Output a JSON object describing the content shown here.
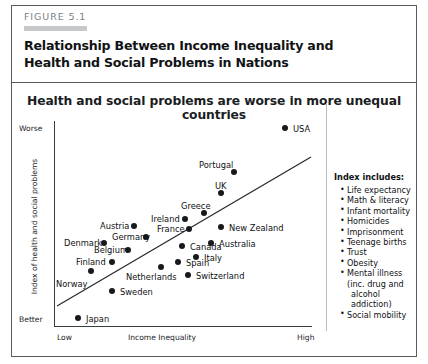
{
  "figure": {
    "number": "FIGURE 5.1",
    "title": "Relationship Between Income Inequality and Health and Social Problems in Nations"
  },
  "chart_data": {
    "type": "scatter",
    "title": "Health and social problems are worse in more unequal countries",
    "xlabel": "Income Inequality",
    "ylabel": "Index of health and social problems",
    "x_tick_labels": [
      "Low",
      "High"
    ],
    "y_tick_labels": [
      "Worse",
      "Better"
    ],
    "grid": false,
    "trendline": true,
    "points": [
      {
        "label": "USA",
        "px": 285,
        "py": 128,
        "lx": 293,
        "ly": 124
      },
      {
        "label": "Portugal",
        "px": 234,
        "py": 172,
        "lx": 199,
        "ly": 160
      },
      {
        "label": "UK",
        "px": 221,
        "py": 193,
        "lx": 215,
        "ly": 181
      },
      {
        "label": "Greece",
        "px": 204,
        "py": 213,
        "lx": 181,
        "ly": 201
      },
      {
        "label": "New Zealand",
        "px": 221,
        "py": 227,
        "lx": 229,
        "ly": 223
      },
      {
        "label": "Australia",
        "px": 211,
        "py": 243,
        "lx": 219,
        "ly": 239
      },
      {
        "label": "Ireland",
        "px": 185,
        "py": 219,
        "lx": 151,
        "ly": 214
      },
      {
        "label": "France",
        "px": 189,
        "py": 229,
        "lx": 157,
        "ly": 224
      },
      {
        "label": "Canada",
        "px": 182,
        "py": 246,
        "lx": 190,
        "ly": 242
      },
      {
        "label": "Italy",
        "px": 196,
        "py": 257,
        "lx": 204,
        "ly": 253
      },
      {
        "label": "Spain",
        "px": 178,
        "py": 262,
        "lx": 186,
        "ly": 258
      },
      {
        "label": "Switzerland",
        "px": 188,
        "py": 275,
        "lx": 196,
        "ly": 271
      },
      {
        "label": "Austria",
        "px": 134,
        "py": 226,
        "lx": 100,
        "ly": 221
      },
      {
        "label": "Germany",
        "px": 146,
        "py": 237,
        "lx": 112,
        "ly": 232
      },
      {
        "label": "Belgium",
        "px": 128,
        "py": 250,
        "lx": 94,
        "ly": 245
      },
      {
        "label": "Denmark",
        "px": 104,
        "py": 243,
        "lx": 64,
        "ly": 238
      },
      {
        "label": "Finland",
        "px": 112,
        "py": 262,
        "lx": 76,
        "ly": 257
      },
      {
        "label": "Netherlands",
        "px": 161,
        "py": 267,
        "lx": 126,
        "ly": 272
      },
      {
        "label": "Norway",
        "px": 91,
        "py": 271,
        "lx": 56,
        "ly": 279
      },
      {
        "label": "Sweden",
        "px": 112,
        "py": 291,
        "lx": 120,
        "ly": 287
      },
      {
        "label": "Japan",
        "px": 78,
        "py": 318,
        "lx": 86,
        "ly": 314
      }
    ],
    "trendline_coords": {
      "x1": 57,
      "y1": 306,
      "x2": 311,
      "y2": 157
    }
  },
  "legend": {
    "title": "Index includes:",
    "items": [
      {
        "text": "Life expectancy",
        "style": "bullet"
      },
      {
        "text": "Math & literacy",
        "style": "bullet"
      },
      {
        "text": "Infant mortality",
        "style": "bullet"
      },
      {
        "text": "Homicides",
        "style": "bullet"
      },
      {
        "text": "Imprisonment",
        "style": "bullet"
      },
      {
        "text": "Teenage births",
        "style": "bullet"
      },
      {
        "text": "Trust",
        "style": "bullet"
      },
      {
        "text": "Obesity",
        "style": "bullet"
      },
      {
        "text": "Mental illness",
        "style": "bullet"
      },
      {
        "text": "(inc. drug and",
        "style": "cont"
      },
      {
        "text": "alcohol addiction)",
        "style": "cont2"
      },
      {
        "text": "Social mobility",
        "style": "bullet"
      }
    ]
  }
}
